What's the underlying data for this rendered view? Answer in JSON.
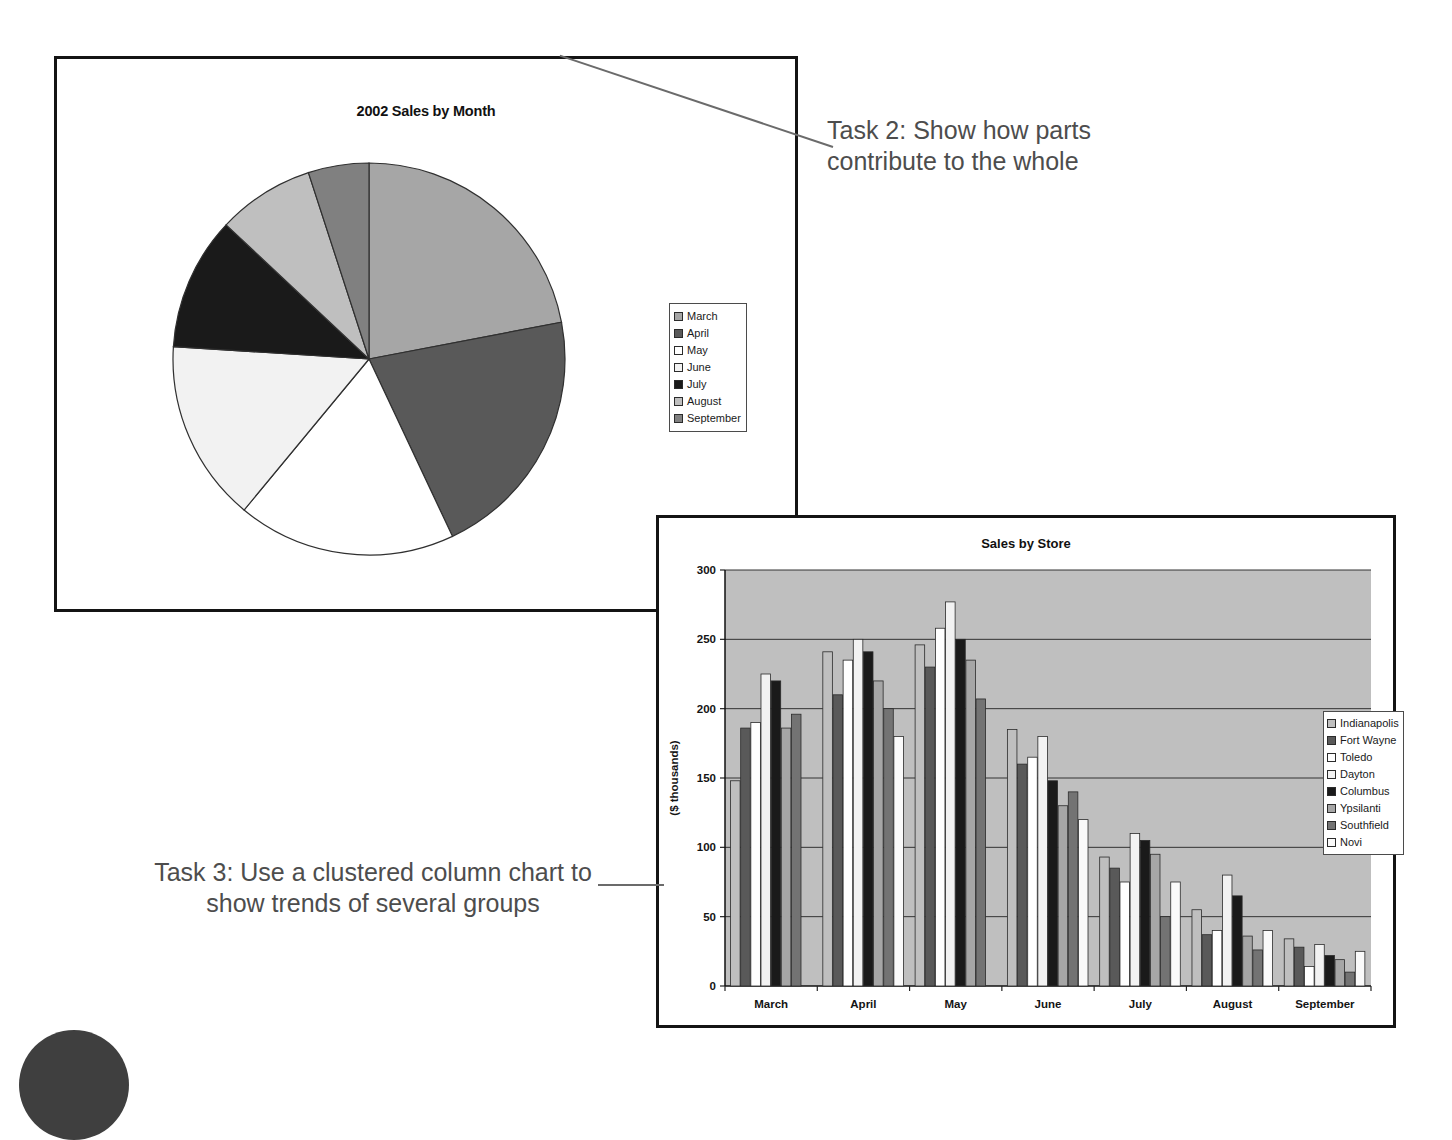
{
  "pie_panel": {
    "title": "2002 Sales by Month",
    "legend": [
      {
        "label": "March",
        "color": "#a6a6a6"
      },
      {
        "label": "April",
        "color": "#595959"
      },
      {
        "label": "May",
        "color": "#ffffff"
      },
      {
        "label": "June",
        "color": "#f2f2f2"
      },
      {
        "label": "July",
        "color": "#1a1a1a"
      },
      {
        "label": "August",
        "color": "#bfbfbf"
      },
      {
        "label": "September",
        "color": "#808080"
      }
    ]
  },
  "bar_panel": {
    "title": "Sales by Store",
    "legend": [
      {
        "label": "Indianapolis",
        "color": "#bfbfbf"
      },
      {
        "label": "Fort Wayne",
        "color": "#595959"
      },
      {
        "label": "Toledo",
        "color": "#ffffff"
      },
      {
        "label": "Dayton",
        "color": "#f2f2f2"
      },
      {
        "label": "Columbus",
        "color": "#1a1a1a"
      },
      {
        "label": "Ypsilanti",
        "color": "#a6a6a6"
      },
      {
        "label": "Southfield",
        "color": "#737373"
      },
      {
        "label": "Novi",
        "color": "#fafafa"
      }
    ]
  },
  "annotations": {
    "task2": "Task 2: Show how parts contribute to the whole",
    "task3": "Task 3: Use a clustered column chart to show trends of several groups"
  },
  "chart_data": [
    {
      "type": "pie",
      "title": "2002 Sales by Month",
      "labels": [
        "March",
        "April",
        "May",
        "June",
        "July",
        "August",
        "September"
      ],
      "values": [
        22,
        21,
        18,
        15,
        11,
        8,
        5
      ],
      "colors": [
        "#a6a6a6",
        "#595959",
        "#ffffff",
        "#f2f2f2",
        "#1a1a1a",
        "#bfbfbf",
        "#808080"
      ],
      "legend_position": "right",
      "start_angle_deg": 0,
      "direction": "clockwise"
    },
    {
      "type": "bar",
      "subtype": "clustered-column",
      "title": "Sales by Store",
      "xlabel": "",
      "ylabel": "($ thousands)",
      "ylim": [
        0,
        300
      ],
      "yticks": [
        0,
        50,
        100,
        150,
        200,
        250,
        300
      ],
      "grid": true,
      "legend_position": "right",
      "plot_background": "#bfbfbf",
      "categories": [
        "March",
        "April",
        "May",
        "June",
        "July",
        "August",
        "September"
      ],
      "series": [
        {
          "name": "Indianapolis",
          "color": "#bfbfbf",
          "values": [
            148,
            241,
            246,
            185,
            93,
            55,
            34
          ]
        },
        {
          "name": "Fort Wayne",
          "color": "#595959",
          "values": [
            186,
            210,
            230,
            160,
            85,
            37,
            28
          ]
        },
        {
          "name": "Toledo",
          "color": "#ffffff",
          "values": [
            190,
            235,
            258,
            165,
            75,
            40,
            14
          ]
        },
        {
          "name": "Dayton",
          "color": "#f2f2f2",
          "values": [
            225,
            250,
            277,
            180,
            110,
            80,
            30
          ]
        },
        {
          "name": "Columbus",
          "color": "#1a1a1a",
          "values": [
            220,
            241,
            250,
            148,
            105,
            65,
            22
          ]
        },
        {
          "name": "Ypsilanti",
          "color": "#a6a6a6",
          "values": [
            186,
            220,
            235,
            130,
            95,
            36,
            19
          ]
        },
        {
          "name": "Southfield",
          "color": "#737373",
          "values": [
            196,
            200,
            207,
            140,
            50,
            26,
            10
          ]
        },
        {
          "name": "Novi",
          "color": "#fafafa",
          "values": [
            0,
            180,
            0,
            120,
            75,
            40,
            25
          ]
        }
      ]
    }
  ]
}
